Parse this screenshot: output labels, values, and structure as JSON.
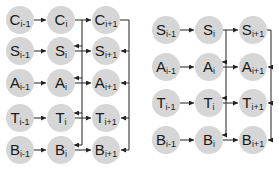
{
  "diagrams": [
    {
      "name": "left-diagram",
      "rows": [
        {
          "letter": "C",
          "y": 20
        },
        {
          "letter": "S",
          "y": 51
        },
        {
          "letter": "A",
          "y": 83
        },
        {
          "letter": "T",
          "y": 118
        },
        {
          "letter": "B",
          "y": 150
        }
      ],
      "columns": [
        {
          "sub": "i-1",
          "x": 20
        },
        {
          "sub": "i",
          "x": 61
        },
        {
          "sub": "i+1",
          "x": 106
        }
      ],
      "inner_bus_x": 82,
      "outer_bus_x": 129
    },
    {
      "name": "right-diagram",
      "rows": [
        {
          "letter": "S",
          "y": 30
        },
        {
          "letter": "A",
          "y": 67
        },
        {
          "letter": "T",
          "y": 103
        },
        {
          "letter": "B",
          "y": 140
        }
      ],
      "columns": [
        {
          "sub": "i-1",
          "x": 166
        },
        {
          "sub": "i",
          "x": 209
        },
        {
          "sub": "i+1",
          "x": 253
        }
      ],
      "inner_bus_x": 226,
      "outer_bus_x": 271
    }
  ],
  "style": {
    "node_fill": "#d6d6d6",
    "edge_color": "#222222",
    "node_radius": 14
  }
}
